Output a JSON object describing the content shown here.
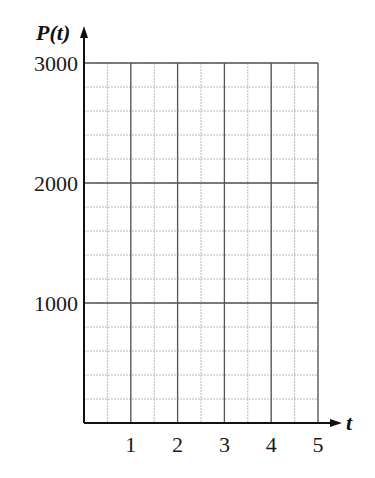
{
  "chart_data": {
    "type": "line",
    "title": "",
    "xlabel": "t",
    "ylabel": "P(t)",
    "xlim": [
      0,
      5
    ],
    "ylim": [
      0,
      3000
    ],
    "x_ticks": [
      1,
      2,
      3,
      4,
      5
    ],
    "x_tick_labels": [
      "1",
      "2",
      "3",
      "4",
      "5"
    ],
    "y_ticks": [
      1000,
      2000,
      3000
    ],
    "y_tick_labels": [
      "1000",
      "2000",
      "3000"
    ],
    "x_minor_step": 0.5,
    "y_minor_step": 200,
    "grid": true,
    "series": [],
    "legend": null
  },
  "colors": {
    "major_grid": "#555555",
    "minor_grid": "#b8b8b8",
    "axis": "#111111"
  }
}
